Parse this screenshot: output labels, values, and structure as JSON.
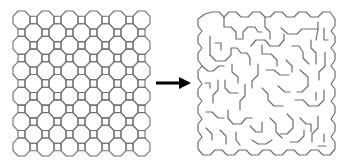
{
  "figure": {
    "left_panel": {
      "label": "Octagon-square tiling grid",
      "lattice_steps": 10,
      "step": 12,
      "octagon_width": 17,
      "origin": [
        13,
        11
      ],
      "scale_y": 1.058,
      "stroke_color": "#707070"
    },
    "arrow": {
      "label": "transforms into",
      "from": [
        156,
        83
      ],
      "to": [
        191,
        83
      ],
      "color": "#000000"
    },
    "right_panel": {
      "label": "Maze generated on octagon-square tiling",
      "origin": [
        197,
        12
      ],
      "stroke_color": "#6e6e6e",
      "walls": [
        "M205,14 L212,12 L219,12 L224,17 L229,12 L236,12 L241,17 L248,17 L253,12 L260,12 L265,17 L270,17 L275,12 L282,12 L287,17 L294,17 L299,12 L306,12 L311,17 L318,17 L323,12 L330,12 L335,19 L335,26 L331,31 L335,36 L335,43 L331,48 L335,53 L335,60 L331,66 L335,71 L335,78 L331,84 L335,89 L335,96 L331,101 L335,106 L335,113 L331,119 L335,124 L335,131 L331,137 L335,142 L335,149 L330,155 L323,155 L318,150 L311,150 L306,155 L299,155 L294,150 L287,150 L282,155 L275,155 L270,150 L263,150 L258,155 L251,155 L246,150 L239,150 L234,155 L227,155 L222,150 L215,150 L210,155 L203,155 L198,149 L198,142 L202,137 L198,131 L198,124 L202,119 L198,113 L198,106 L202,101 L198,96 L198,89 L202,84 L198,78 L198,71 L202,66 L198,60 L198,53 L202,48 L198,43 L198,36 L202,31 L198,26 L198,19 Z",
        "M224,17 L224,27 L231,27 L236,32 L236,39 L243,39 L243,32 L248,27 L255,27 L258,32 L262,32",
        "M265,17 L265,27 L270,32 L270,39",
        "M281,28 L288,34 L297,34 L302,29 L311,29 L318,29",
        "M316,40 L318,29 L318,22",
        "M324,28 L324,40 L328,40",
        "M210,36 L210,55",
        "M215,43 L221,43 L221,50",
        "M210,55 L216,61 L225,61 L231,55 L231,48 L237,48 L241,53 L247,53 L250,58 L250,65",
        "M251,46 L256,40 L265,40 L270,46 L279,46 L284,40 L284,34",
        "M262,45 L262,54 L271,54 L277,60 L277,66",
        "M292,46 L299,46 L303,52 L303,58 L309,64",
        "M311,40 L311,48 L316,53 L316,64",
        "M325,52 L325,66 L319,72 L319,80",
        "M202,66 L208,71 L213,71 L219,66 L224,66",
        "M232,64 L232,72 L238,77 L238,83",
        "M258,64 L258,75 L252,81 L252,88",
        "M266,70 L274,70 L280,75 L289,75",
        "M286,60 L292,66 L292,72",
        "M300,70 L308,77 L308,86 L302,92 L297,92",
        "M205,83 L210,83 L210,88",
        "M218,80 L218,90 L213,95 L213,103",
        "M225,80 L225,88 L230,93 L238,93",
        "M245,84 L245,96 L240,101 L240,110",
        "M262,88 L268,94 L268,100 L274,106 L283,106",
        "M278,86 L285,92 L290,92",
        "M295,100 L303,100 L309,106 L318,106 L324,100 L324,90",
        "M316,92 L316,100",
        "M206,112 L212,112 L218,118 L224,118",
        "M228,110 L228,118 L233,124 L241,124 L246,118 L252,118",
        "M236,132 L236,140 L240,145",
        "M250,126 L256,132 L262,132 L262,122",
        "M270,118 L276,124 L276,132 L282,138",
        "M287,114 L293,120 L293,128 L287,134 L280,134",
        "M300,118 L306,124 L311,124 L311,132",
        "M318,116 L318,128 L312,134 L312,142",
        "M324,134 L324,142",
        "M206,128 L212,134 L212,140",
        "M220,130 L226,136 L226,144",
        "M252,140 L258,144 L266,144 L272,140",
        "M290,142 L298,142 L304,136 L304,130",
        "M318,146 L326,146"
      ]
    }
  }
}
